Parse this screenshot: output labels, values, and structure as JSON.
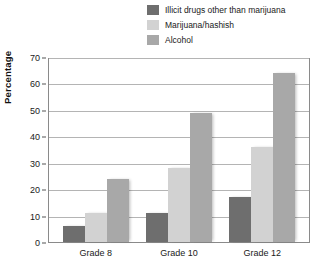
{
  "chart_data": {
    "type": "bar",
    "title": "",
    "xlabel": "",
    "ylabel": "Percentage",
    "ylim": [
      0,
      70
    ],
    "ytick_step": 10,
    "yticks": [
      "0",
      "10",
      "20",
      "30",
      "40",
      "50",
      "60",
      "70"
    ],
    "grid": "horizontal",
    "legend_position": "top-right",
    "categories": [
      "Grade 8",
      "Grade 10",
      "Grade 12"
    ],
    "series": [
      {
        "name": "Illicit drugs other than marijuana",
        "color": "#6e6e6e",
        "values": [
          6,
          11,
          17
        ]
      },
      {
        "name": "Marijuana/hashish",
        "color": "#d2d2d2",
        "values": [
          11,
          28,
          36
        ]
      },
      {
        "name": "Alcohol",
        "color": "#a8a8a8",
        "values": [
          24,
          49,
          64
        ]
      }
    ]
  },
  "colors": {
    "frame": "#8a8a8a",
    "gridline": "#b4b4b4",
    "text": "#1a1a1a",
    "background": "#ffffff"
  }
}
